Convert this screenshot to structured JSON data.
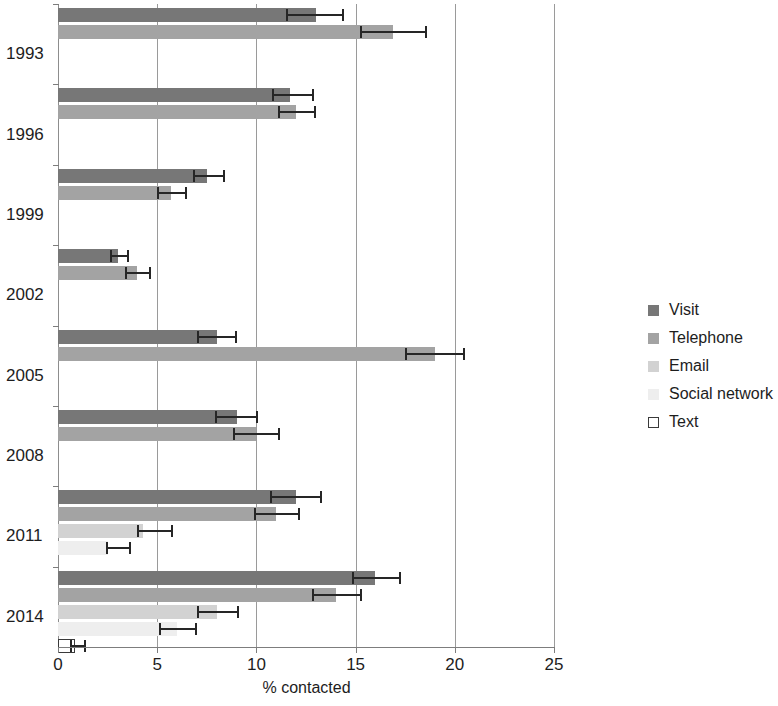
{
  "chart_data": {
    "type": "bar",
    "orientation": "horizontal",
    "title": "",
    "subtitle": "",
    "xlabel": "% contacted",
    "ylabel": "",
    "xlim": [
      0,
      25
    ],
    "xticks": [
      0,
      5,
      10,
      15,
      20,
      25
    ],
    "xtick_labels": [
      "0",
      "5",
      "10",
      "15",
      "20",
      "25"
    ],
    "categories": [
      "1993",
      "1996",
      "1999",
      "2002",
      "2005",
      "2008",
      "2011",
      "2014"
    ],
    "grid": "vertical",
    "legend_position": "right",
    "error_bars": "horizontal caps",
    "series": [
      {
        "name": "Visit",
        "color": "#777777",
        "values": [
          13.0,
          11.7,
          7.5,
          3.0,
          8.0,
          9.0,
          12.0,
          16.0
        ],
        "err_low": [
          11.5,
          10.8,
          6.8,
          2.6,
          7.0,
          7.9,
          10.7,
          14.8
        ],
        "err_high": [
          14.4,
          12.9,
          8.4,
          3.6,
          9.0,
          10.1,
          13.3,
          17.3
        ]
      },
      {
        "name": "Telephone",
        "color": "#a3a3a3",
        "values": [
          16.9,
          12.0,
          5.7,
          4.0,
          19.0,
          10.0,
          11.0,
          14.0
        ],
        "err_low": [
          15.2,
          11.1,
          5.0,
          3.4,
          17.5,
          8.8,
          9.9,
          12.8
        ],
        "err_high": [
          18.6,
          13.0,
          6.5,
          4.7,
          20.5,
          11.2,
          12.2,
          15.3
        ]
      },
      {
        "name": "Email",
        "color": "#d2d2d2",
        "values": [
          null,
          null,
          null,
          null,
          null,
          null,
          4.3,
          8.0
        ],
        "err_low": [
          null,
          null,
          null,
          null,
          null,
          null,
          4.0,
          7.0
        ],
        "err_high": [
          null,
          null,
          null,
          null,
          null,
          null,
          5.8,
          9.1
        ]
      },
      {
        "name": "Social network",
        "color": "#eeeeee",
        "values": [
          null,
          null,
          null,
          null,
          null,
          null,
          2.5,
          6.0
        ],
        "err_low": [
          null,
          null,
          null,
          null,
          null,
          null,
          2.4,
          5.1
        ],
        "err_high": [
          null,
          null,
          null,
          null,
          null,
          null,
          3.7,
          7.0
        ]
      },
      {
        "name": "Text",
        "color": "#ffffff",
        "values": [
          null,
          null,
          null,
          null,
          null,
          null,
          null,
          0.85
        ],
        "err_low": [
          null,
          null,
          null,
          null,
          null,
          null,
          null,
          0.6
        ],
        "err_high": [
          null,
          null,
          null,
          null,
          null,
          null,
          null,
          1.4
        ]
      }
    ]
  },
  "axis": {
    "x_title": "% contacted",
    "tick_labels": [
      "0",
      "5",
      "10",
      "15",
      "20",
      "25"
    ],
    "year_labels": [
      "1993",
      "1996",
      "1999",
      "2002",
      "2005",
      "2008",
      "2011",
      "2014"
    ]
  },
  "legend": {
    "items": [
      {
        "label": "Visit",
        "key": "visit"
      },
      {
        "label": "Telephone",
        "key": "telephone"
      },
      {
        "label": "Email",
        "key": "email"
      },
      {
        "label": "Social network",
        "key": "social-network"
      },
      {
        "label": "Text",
        "key": "text"
      }
    ]
  }
}
